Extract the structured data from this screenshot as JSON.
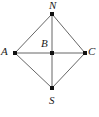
{
  "figure": {
    "background_color": "#ffffff",
    "stroke_color": "#555555",
    "point_color": "#111111",
    "label_color": "#1a1a1a",
    "width": 99,
    "height": 117,
    "points": [
      {
        "id": "N",
        "label": "N",
        "x": 52,
        "y": 14,
        "label_position": "above"
      },
      {
        "id": "A",
        "label": "A",
        "x": 15,
        "y": 53,
        "label_position": "left"
      },
      {
        "id": "B",
        "label": "B",
        "x": 52,
        "y": 53,
        "label_position": "above-left"
      },
      {
        "id": "C",
        "label": "C",
        "x": 85,
        "y": 53,
        "label_position": "right"
      },
      {
        "id": "S",
        "label": "S",
        "x": 52,
        "y": 88,
        "label_position": "below"
      }
    ],
    "segments": [
      {
        "from": "A",
        "to": "N"
      },
      {
        "from": "N",
        "to": "C"
      },
      {
        "from": "C",
        "to": "S"
      },
      {
        "from": "S",
        "to": "A"
      },
      {
        "from": "A",
        "to": "C"
      },
      {
        "from": "N",
        "to": "S"
      }
    ]
  },
  "labels": {
    "N": "N",
    "A": "A",
    "B": "B",
    "C": "C",
    "S": "S"
  }
}
